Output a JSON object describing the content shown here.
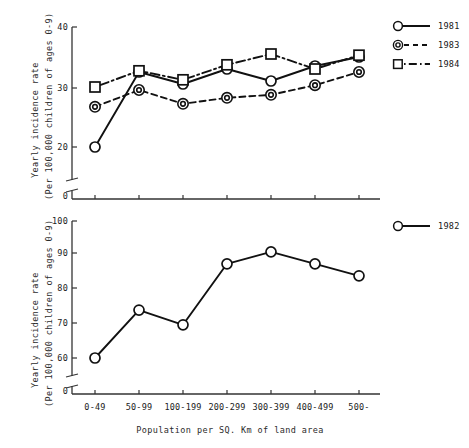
{
  "figure": {
    "xlabel": "Population per SQ. Km of land area",
    "ylabel_line1": "Yearly incidence rate",
    "ylabel_line2": "(Per 100,000 children of ages 0-9)"
  },
  "chart_data": [
    {
      "type": "line",
      "panel": "top",
      "title": "",
      "xlabel": "",
      "ylabel": "Yearly incidence rate (Per 100,000 children of ages 0-9)",
      "categories": [
        "0-49",
        "50-99",
        "100-199",
        "200-299",
        "300-399",
        "400-499",
        "500-"
      ],
      "ylim": [
        20,
        40
      ],
      "yticks": [
        20,
        30,
        40
      ],
      "ytick_labels": [
        "20",
        "30",
        "40"
      ],
      "axis_break": true,
      "axis_origin_label": "0",
      "grid": false,
      "legend_position": "right",
      "series": [
        {
          "name": "1981",
          "marker": "open-circle",
          "linestyle": "solid",
          "values": [
            20.0,
            32.5,
            30.5,
            33.0,
            31.0,
            33.5,
            35.0
          ]
        },
        {
          "name": "1983",
          "marker": "double-circle",
          "linestyle": "dashed",
          "values": [
            26.7,
            29.5,
            27.2,
            28.2,
            28.7,
            30.3,
            32.5
          ]
        },
        {
          "name": "1984",
          "marker": "open-square",
          "linestyle": "dash-dot",
          "values": [
            30.0,
            32.7,
            31.2,
            33.7,
            35.5,
            33.0,
            35.3
          ]
        }
      ]
    },
    {
      "type": "line",
      "panel": "bottom",
      "title": "",
      "xlabel": "Population per SQ. Km of land area",
      "ylabel": "Yearly incidence rate (Per 100,000 children of ages 0-9)",
      "categories": [
        "0-49",
        "50-99",
        "100-199",
        "200-299",
        "300-399",
        "400-499",
        "500-"
      ],
      "ylim": [
        60,
        100
      ],
      "yticks": [
        60,
        70,
        80,
        90,
        100
      ],
      "ytick_labels": [
        "60",
        "70",
        "80",
        "90",
        "100"
      ],
      "axis_break": true,
      "axis_origin_label": "0",
      "grid": false,
      "legend_position": "right",
      "series": [
        {
          "name": "1982",
          "marker": "open-circle",
          "linestyle": "solid",
          "values": [
            60.0,
            74.0,
            69.7,
            87.5,
            91.0,
            87.5,
            84.0
          ]
        }
      ]
    }
  ],
  "top_panel": {
    "yticks": [
      "40",
      "30",
      "20"
    ],
    "origin": "0",
    "legend": [
      {
        "label": "1981"
      },
      {
        "label": "1983"
      },
      {
        "label": "1984"
      }
    ]
  },
  "bottom_panel": {
    "yticks": [
      "100",
      "90",
      "80",
      "70",
      "60"
    ],
    "origin": "0",
    "xticks": [
      "0-49",
      "50-99",
      "100-199",
      "200-299",
      "300-399",
      "400-499",
      "500-"
    ],
    "legend": [
      {
        "label": "1982"
      }
    ]
  }
}
